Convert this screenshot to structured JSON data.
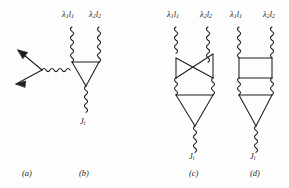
{
  "figure": {
    "type": "feynman-diagram-set",
    "background_color": "#fdfdfd",
    "ink_color": "#1d1d1d",
    "panels": [
      {
        "id": "a",
        "caption": "(a)",
        "description": "two incoming fermion arrows meeting a vertex with an outgoing wavy photon line",
        "labels": []
      },
      {
        "id": "b",
        "caption": "(b)",
        "description": "triangle loop with two incoming wavy photon lines and one outgoing wavy current line",
        "labels": [
          "lambda1-l1",
          "lambda2-l2",
          "Ji"
        ]
      },
      {
        "id": "c",
        "caption": "(c)",
        "description": "crossed box loop above a triangle loop, two wavy photon lines in, one wavy current line out",
        "labels": [
          "lambda1-l1",
          "lambda2-l2",
          "Ji"
        ]
      },
      {
        "id": "d",
        "caption": "(d)",
        "description": "rectangular box loop above a triangle loop, two wavy photon lines in, one wavy current line out",
        "labels": [
          "lambda1-l1",
          "lambda2-l2",
          "Ji"
        ]
      }
    ]
  },
  "labels": {
    "photon1": {
      "base": "λ",
      "sub1": "1",
      "mid": "l",
      "sub2": "1"
    },
    "photon2": {
      "base": "λ",
      "sub1": "2",
      "mid": "l",
      "sub2": "2"
    },
    "current": {
      "base": "J",
      "sub": "i"
    }
  },
  "label_text": {
    "photon1_full": "λ₁l₁",
    "photon2_full": "λ₂l₂",
    "current_full": "Jᵢ"
  },
  "captions": {
    "a": "(a)",
    "b": "(b)",
    "c": "(c)",
    "d": "(d)"
  },
  "glyph_parts": {
    "lambda": "λ",
    "ell": "l",
    "one": "1",
    "two": "2",
    "jay": "J",
    "eye": "i"
  }
}
